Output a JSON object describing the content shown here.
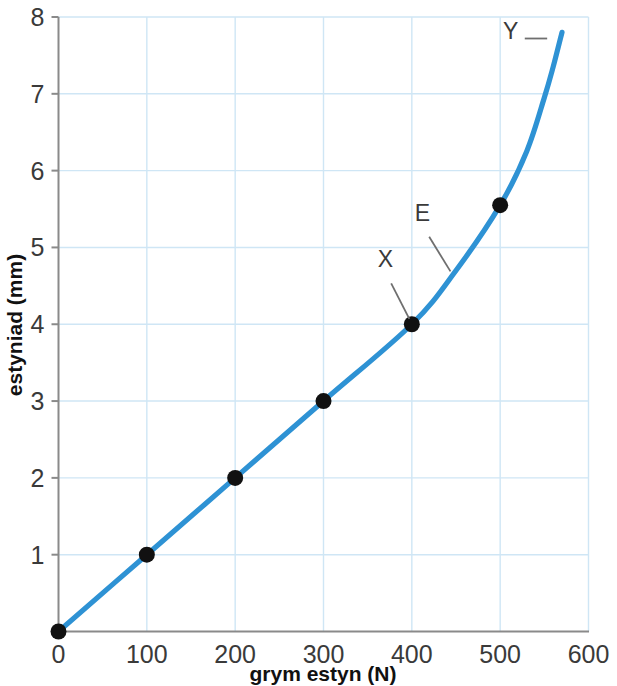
{
  "chart_data": {
    "type": "line",
    "title": "",
    "subtitle": "",
    "xlabel": "grym estyn (N)",
    "ylabel": "estyniad (mm)",
    "xlim": [
      0,
      600
    ],
    "ylim": [
      0,
      8
    ],
    "x_ticks": [
      0,
      100,
      200,
      300,
      400,
      500,
      600
    ],
    "x_tick_labels": [
      "0",
      "100",
      "200",
      "300",
      "400",
      "500",
      "600"
    ],
    "y_ticks": [
      0,
      1,
      2,
      3,
      4,
      5,
      6,
      7,
      8
    ],
    "y_tick_labels": [
      "",
      "1",
      "2",
      "3",
      "4",
      "5",
      "6",
      "7",
      "8"
    ],
    "grid": true,
    "grid_color": "#cfe6f5",
    "legend": null,
    "line_color": "#2e92d4",
    "marker_color": "#111111",
    "series": [
      {
        "name": "extension vs force",
        "x": [
          0,
          100,
          200,
          300,
          400,
          450,
          500,
          530,
          550,
          560,
          570
        ],
        "y": [
          0,
          1.0,
          2.0,
          3.0,
          4.0,
          4.7,
          5.55,
          6.25,
          6.95,
          7.35,
          7.8
        ]
      }
    ],
    "markers": [
      {
        "x": 0,
        "y": 0
      },
      {
        "x": 100,
        "y": 1.0
      },
      {
        "x": 200,
        "y": 2.0
      },
      {
        "x": 300,
        "y": 3.0
      },
      {
        "x": 400,
        "y": 4.0
      },
      {
        "x": 500,
        "y": 5.55
      }
    ],
    "annotations": [
      {
        "label": "X",
        "text_x": 370,
        "text_y": 4.75,
        "target_x": 400,
        "target_y": 4.0
      },
      {
        "label": "E",
        "text_x": 412,
        "text_y": 5.35,
        "target_x": 447,
        "target_y": 4.62
      },
      {
        "label": "Y",
        "text_x": 512,
        "text_y": 7.72,
        "target_x": 560,
        "target_y": 7.72
      }
    ]
  },
  "axis": {
    "x_label": "grym estyn (N)",
    "y_label": "estyniad (mm)"
  },
  "ticks": {
    "x": [
      "0",
      "100",
      "200",
      "300",
      "400",
      "500",
      "600"
    ],
    "y": [
      "1",
      "2",
      "3",
      "4",
      "5",
      "6",
      "7",
      "8"
    ]
  },
  "annotations": {
    "x_point": "X",
    "elastic_region": "E",
    "y_point": "Y"
  },
  "colors": {
    "curve": "#2e92d4",
    "grid": "#cfe6f5",
    "axis": "#7a7a7a",
    "marker": "#111111",
    "text": "#3a3a3a"
  }
}
